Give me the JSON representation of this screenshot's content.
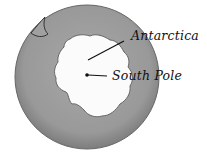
{
  "diagram": {
    "labels": {
      "antarctica": "Antarctica",
      "south_pole": "South Pole"
    },
    "colors": {
      "ocean": "#9a9a9a",
      "ocean_edge": "#6e6e6e",
      "continent": "#fbfbfb",
      "outline": "#555555",
      "text": "#111111"
    }
  }
}
